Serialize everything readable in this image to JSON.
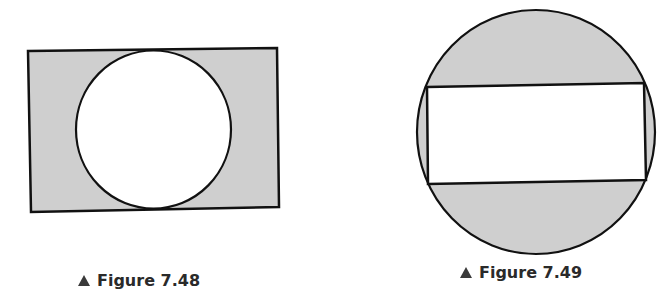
{
  "figures": [
    {
      "id": "fig-7-48",
      "caption": "Figure 7.48",
      "description": "Circle inscribed in a rectangle; region outside the circle shaded",
      "shapes": {
        "rectangle": {
          "fill": "#cfcfcf",
          "stroke": "#111111"
        },
        "circle": {
          "fill": "#ffffff",
          "stroke": "#111111"
        }
      }
    },
    {
      "id": "fig-7-49",
      "caption": "Figure 7.49",
      "description": "Rectangle inscribed in a circle; region outside the rectangle shaded",
      "shapes": {
        "circle": {
          "fill": "#cfcfcf",
          "stroke": "#111111"
        },
        "rectangle": {
          "fill": "#ffffff",
          "stroke": "#111111"
        }
      }
    }
  ],
  "colors": {
    "shade": "#cfcfcf",
    "line": "#111111",
    "background": "#ffffff",
    "caption_text": "#2a2a2a",
    "caption_marker": "#3a3a3a"
  }
}
